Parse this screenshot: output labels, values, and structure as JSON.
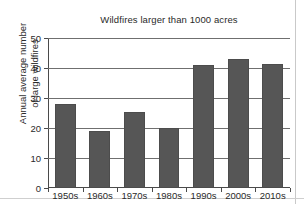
{
  "chart_data": {
    "type": "bar",
    "title": "Wildfires larger than 1000 acres",
    "xlabel": "",
    "ylabel_lines": [
      "Annual average number",
      "of large wildfires"
    ],
    "ylabel": "Annual average number of large wildfires",
    "categories": [
      "1950s",
      "1960s",
      "1970s",
      "1980s",
      "1990s",
      "2000s",
      "2010s"
    ],
    "values": [
      28,
      19,
      25.5,
      20,
      41,
      43,
      41.5
    ],
    "ylim": [
      0,
      50
    ],
    "yticks": [
      0,
      10,
      20,
      30,
      40,
      50
    ],
    "ytick_labels": [
      "0",
      "10",
      "20",
      "30",
      "40",
      "50"
    ],
    "grid": true,
    "grid_axis": "y",
    "legend": false,
    "bar_color": "#565656",
    "axis_color": "#4a4a4a",
    "grid_color": "#6f6f6f",
    "background": "#ffffff"
  }
}
